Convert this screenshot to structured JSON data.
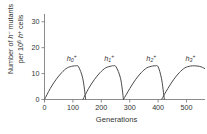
{
  "chart_data": {
    "type": "line",
    "title": "",
    "xlabel": "Generations",
    "ylabel_line1": "Number of h⁻ mutants",
    "ylabel_line2": "per 10⁶ h⁺ cells",
    "xlim": [
      0,
      565
    ],
    "ylim": [
      0,
      33
    ],
    "xticks": [
      0,
      100,
      200,
      300,
      400,
      500
    ],
    "yticks": [
      0,
      10,
      20,
      30
    ],
    "grid": false,
    "legend": "inline-curve-labels",
    "series": [
      {
        "name": "h0+",
        "label_base": "h",
        "label_sub": "0",
        "label_sup": "+",
        "start": 0,
        "peak_x": 110,
        "peak_y": 13,
        "end": 145,
        "x": [
          0,
          20,
          40,
          60,
          80,
          100,
          110,
          120,
          135,
          145
        ],
        "y": [
          0,
          4.2,
          7.6,
          10.3,
          12.2,
          12.9,
          13.0,
          12.6,
          8.0,
          0
        ]
      },
      {
        "name": "h1+",
        "label_base": "h",
        "label_sub": "1",
        "label_sup": "+",
        "start": 135,
        "peak_x": 242,
        "peak_y": 13,
        "end": 278,
        "x": [
          135,
          155,
          175,
          195,
          215,
          235,
          242,
          252,
          268,
          278
        ],
        "y": [
          0,
          4.2,
          7.6,
          10.3,
          12.2,
          12.9,
          13.0,
          12.6,
          8.0,
          0
        ]
      },
      {
        "name": "h2+",
        "label_base": "h",
        "label_sub": "2",
        "label_sup": "+",
        "start": 278,
        "peak_x": 390,
        "peak_y": 13,
        "end": 422,
        "x": [
          278,
          300,
          320,
          340,
          360,
          380,
          390,
          400,
          412,
          422
        ],
        "y": [
          0,
          4.2,
          7.6,
          10.3,
          12.2,
          12.9,
          13.0,
          12.6,
          8.0,
          0
        ]
      },
      {
        "name": "h3+",
        "label_base": "h",
        "label_sub": "3",
        "label_sup": "+",
        "start": 412,
        "peak_x": 528,
        "peak_y": 13,
        "end": 565,
        "x": [
          412,
          434,
          454,
          474,
          494,
          514,
          528,
          545,
          556,
          565
        ],
        "y": [
          0,
          4.2,
          7.6,
          10.3,
          12.2,
          12.9,
          13.0,
          12.8,
          12.4,
          11.9
        ]
      }
    ],
    "colors": {
      "curve": "#4a4a4a",
      "axis": "#8c8c8c",
      "text": "#333333",
      "background": "#ffffff"
    }
  },
  "axis_tick_labels": {
    "x": [
      "0",
      "100",
      "200",
      "300",
      "400",
      "500"
    ],
    "y": [
      "0",
      "10",
      "20",
      "30"
    ]
  },
  "curve_labels": [
    "h0+",
    "h1+",
    "h2+",
    "h3+"
  ]
}
